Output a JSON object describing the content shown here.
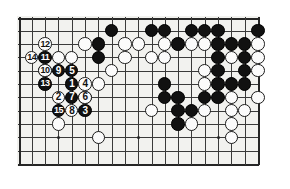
{
  "diagram": {
    "kind": "go-board-diagram",
    "board": {
      "columns": 19,
      "rows": 12,
      "cell_size": 13.3,
      "origin_x": 18.5,
      "origin_y": 17.5,
      "grid_color": "#3a3a3a",
      "edge_color": "#262626",
      "background_color": "#f2f2ef"
    },
    "star_points": [
      {
        "col": 3,
        "row": 9
      },
      {
        "col": 9,
        "row": 9
      },
      {
        "col": 15,
        "row": 9
      }
    ],
    "plain_stones": [
      {
        "col": 7,
        "row": 1,
        "color": "black"
      },
      {
        "col": 10,
        "row": 1,
        "color": "black"
      },
      {
        "col": 11,
        "row": 1,
        "color": "black"
      },
      {
        "col": 13,
        "row": 1,
        "color": "black"
      },
      {
        "col": 14,
        "row": 1,
        "color": "black"
      },
      {
        "col": 15,
        "row": 1,
        "color": "black"
      },
      {
        "col": 18,
        "row": 1,
        "color": "black"
      },
      {
        "col": 5,
        "row": 2,
        "color": "white"
      },
      {
        "col": 6,
        "row": 2,
        "color": "black"
      },
      {
        "col": 8,
        "row": 2,
        "color": "white"
      },
      {
        "col": 9,
        "row": 2,
        "color": "white"
      },
      {
        "col": 11,
        "row": 2,
        "color": "white"
      },
      {
        "col": 12,
        "row": 2,
        "color": "black"
      },
      {
        "col": 13,
        "row": 2,
        "color": "white"
      },
      {
        "col": 14,
        "row": 2,
        "color": "white"
      },
      {
        "col": 15,
        "row": 2,
        "color": "black"
      },
      {
        "col": 16,
        "row": 2,
        "color": "black"
      },
      {
        "col": 17,
        "row": 2,
        "color": "black"
      },
      {
        "col": 18,
        "row": 2,
        "color": "white"
      },
      {
        "col": 3,
        "row": 3,
        "color": "white"
      },
      {
        "col": 4,
        "row": 3,
        "color": "white"
      },
      {
        "col": 6,
        "row": 3,
        "color": "black"
      },
      {
        "col": 8,
        "row": 3,
        "color": "white"
      },
      {
        "col": 10,
        "row": 3,
        "color": "white"
      },
      {
        "col": 11,
        "row": 3,
        "color": "white"
      },
      {
        "col": 15,
        "row": 3,
        "color": "black"
      },
      {
        "col": 16,
        "row": 3,
        "color": "white"
      },
      {
        "col": 17,
        "row": 3,
        "color": "black"
      },
      {
        "col": 18,
        "row": 3,
        "color": "white"
      },
      {
        "col": 2,
        "row": 4,
        "color": "white"
      },
      {
        "col": 7,
        "row": 4,
        "color": "white"
      },
      {
        "col": 14,
        "row": 4,
        "color": "white"
      },
      {
        "col": 15,
        "row": 4,
        "color": "black"
      },
      {
        "col": 17,
        "row": 4,
        "color": "black"
      },
      {
        "col": 18,
        "row": 4,
        "color": "white"
      },
      {
        "col": 6,
        "row": 5,
        "color": "white"
      },
      {
        "col": 11,
        "row": 5,
        "color": "black"
      },
      {
        "col": 14,
        "row": 5,
        "color": "white"
      },
      {
        "col": 15,
        "row": 5,
        "color": "black"
      },
      {
        "col": 16,
        "row": 5,
        "color": "black"
      },
      {
        "col": 17,
        "row": 5,
        "color": "black"
      },
      {
        "col": 5,
        "row": 6,
        "color": "white"
      },
      {
        "col": 11,
        "row": 6,
        "color": "black"
      },
      {
        "col": 12,
        "row": 6,
        "color": "black"
      },
      {
        "col": 14,
        "row": 6,
        "color": "black"
      },
      {
        "col": 15,
        "row": 6,
        "color": "black"
      },
      {
        "col": 16,
        "row": 6,
        "color": "white"
      },
      {
        "col": 18,
        "row": 6,
        "color": "white"
      },
      {
        "col": 10,
        "row": 7,
        "color": "white"
      },
      {
        "col": 12,
        "row": 7,
        "color": "black"
      },
      {
        "col": 13,
        "row": 7,
        "color": "black"
      },
      {
        "col": 14,
        "row": 7,
        "color": "white"
      },
      {
        "col": 16,
        "row": 7,
        "color": "white"
      },
      {
        "col": 17,
        "row": 7,
        "color": "white"
      },
      {
        "col": 12,
        "row": 8,
        "color": "black"
      },
      {
        "col": 13,
        "row": 8,
        "color": "white"
      },
      {
        "col": 16,
        "row": 8,
        "color": "white"
      },
      {
        "col": 3,
        "row": 8,
        "color": "white"
      },
      {
        "col": 6,
        "row": 9,
        "color": "white"
      },
      {
        "col": 16,
        "row": 9,
        "color": "white"
      }
    ],
    "numbered_moves": [
      {
        "number": "1",
        "col": 4,
        "row": 5,
        "color": "black"
      },
      {
        "number": "2",
        "col": 3,
        "row": 6,
        "color": "white"
      },
      {
        "number": "3",
        "col": 5,
        "row": 7,
        "color": "black"
      },
      {
        "number": "4",
        "col": 5,
        "row": 5,
        "color": "white"
      },
      {
        "number": "5",
        "col": 4,
        "row": 4,
        "color": "black"
      },
      {
        "number": "6",
        "col": 5,
        "row": 6,
        "color": "white"
      },
      {
        "number": "7",
        "col": 4,
        "row": 6,
        "color": "black"
      },
      {
        "number": "8",
        "col": 4,
        "row": 7,
        "color": "white"
      },
      {
        "number": "9",
        "col": 3,
        "row": 4,
        "color": "black"
      },
      {
        "number": "10",
        "col": 2,
        "row": 4,
        "color": "white"
      },
      {
        "number": "11",
        "col": 2,
        "row": 3,
        "color": "black"
      },
      {
        "number": "12",
        "col": 2,
        "row": 2,
        "color": "white"
      },
      {
        "number": "13",
        "col": 2,
        "row": 5,
        "color": "black"
      },
      {
        "number": "14",
        "col": 1,
        "row": 3,
        "color": "white"
      },
      {
        "number": "15",
        "col": 3,
        "row": 7,
        "color": "black"
      }
    ]
  }
}
